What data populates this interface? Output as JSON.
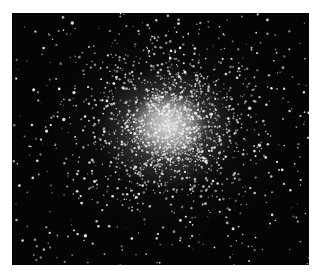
{
  "image": {
    "subject": "globular star cluster",
    "description": "Grayscale astronomical photograph of a dense globular star cluster with a bright, nearly saturated core and a halo of resolved stars thinning outward against a black sky.",
    "colors": {
      "sky": "#050505",
      "core": "#d7d7d7",
      "star": "#f2f2f2",
      "border": "#ffffff"
    },
    "cluster_center": [
      156,
      112
    ],
    "frame": {
      "x": 12,
      "y": 13,
      "width": 297,
      "height": 252
    }
  }
}
